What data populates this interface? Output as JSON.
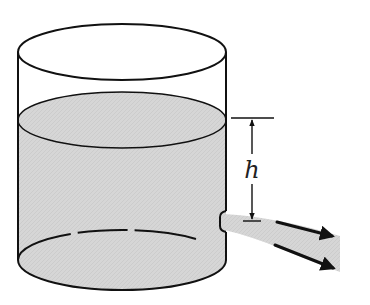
{
  "diagram": {
    "labels": {
      "height": "h"
    },
    "colors": {
      "water": "#d6d6d6",
      "line": "#111111",
      "background": "#ffffff"
    },
    "elements": [
      "tank",
      "water",
      "hole",
      "water-jet",
      "height-dimension",
      "flow-arrows"
    ]
  }
}
